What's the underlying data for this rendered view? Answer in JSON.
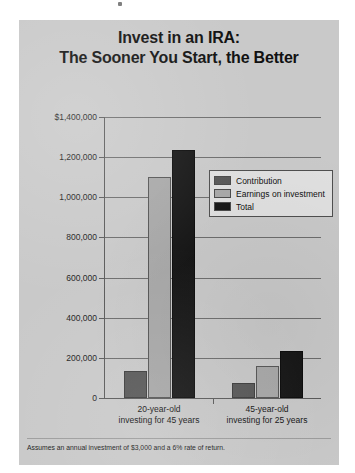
{
  "panel": {
    "background_color": "#c9c9c9"
  },
  "chart_data": {
    "type": "bar",
    "title": "Invest in an IRA:",
    "title_line2": "The Sooner You Start, the Better",
    "subtitle": "",
    "xlabel": "",
    "ylabel": "",
    "grid": true,
    "legend_position": "inside-upper-right",
    "categories": [
      "20-year-old investing for 45 years",
      "45-year-old investing for 25 years"
    ],
    "category_lines": [
      [
        "20-year-old",
        "investing for 45 years"
      ],
      [
        "45-year-old",
        "investing for 25 years"
      ]
    ],
    "series": [
      {
        "name": "Contribution",
        "color": "#585858",
        "values": [
          135000,
          75000
        ]
      },
      {
        "name": "Earnings on investment",
        "color": "#a8a8a8",
        "values": [
          1100000,
          160000
        ]
      },
      {
        "name": "Total",
        "color": "#161616",
        "values": [
          1235000,
          235000
        ]
      }
    ],
    "ylim": [
      0,
      1400000
    ],
    "ytick_values": [
      0,
      200000,
      400000,
      600000,
      800000,
      1000000,
      1200000,
      1400000
    ],
    "ytick_labels": [
      "0",
      "200,000",
      "400,000",
      "600,000",
      "800,000",
      "1,000,000",
      "1,200,000",
      "$1,400,000"
    ],
    "annotations": [
      "Assumes an annual investment of $3,000 and a 6% rate of return."
    ]
  },
  "footnote": "Assumes an annual investment of $3,000 and a 6% rate of return."
}
